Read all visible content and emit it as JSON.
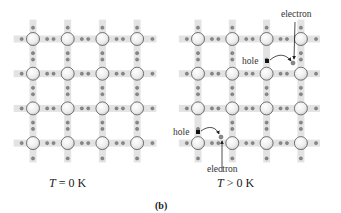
{
  "figure": {
    "caption": "(b)",
    "colors": {
      "bond_strip": "#e3e3e3",
      "atom_fill": "#f2f2f2",
      "atom_stroke": "#555555",
      "electron": "#8a8a8a",
      "hole": "#111111",
      "arrow": "#222222"
    },
    "panels": [
      {
        "id": "left",
        "temperature_var": "T",
        "temperature_label": " = 0 K",
        "grid": {
          "rows": 4,
          "cols": 4,
          "x0": 33,
          "y0": 39,
          "dx": 34.7,
          "dy": 34.7
        },
        "broken_bonds": []
      },
      {
        "id": "right",
        "temperature_var": "T",
        "temperature_label": " > 0 K",
        "grid": {
          "rows": 4,
          "cols": 4,
          "x0": 198,
          "y0": 39,
          "dx": 34.3,
          "dy": 34.7
        },
        "annotations": [
          {
            "hole_label": "hole",
            "electron_label": "electron",
            "hole_pos": [
              267,
              61
            ],
            "electron_pos": [
              293,
              63
            ]
          },
          {
            "hole_label": "hole",
            "electron_label": "electron",
            "hole_pos": [
              198,
              132
            ],
            "electron_pos": [
              221,
              139
            ]
          }
        ]
      }
    ]
  }
}
